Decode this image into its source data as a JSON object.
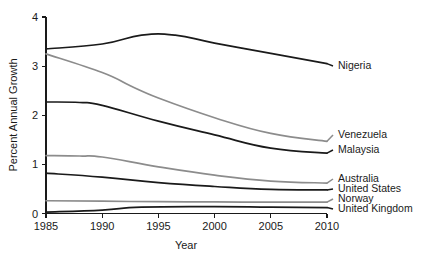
{
  "chart_data": {
    "type": "line",
    "title": "",
    "xlabel": "Year",
    "ylabel": "Percent Annual Growth",
    "xlim": [
      1985,
      2010
    ],
    "ylim": [
      0,
      4
    ],
    "grid": false,
    "legend_position": "right-inline-labels",
    "x": [
      1985,
      1990,
      1995,
      2000,
      2005,
      2010
    ],
    "xticks": [
      "1985",
      "1990",
      "1995",
      "2000",
      "2005",
      "2010"
    ],
    "yticks": [
      "0",
      "1",
      "2",
      "3",
      "4"
    ],
    "series": [
      {
        "name": "Nigeria",
        "color": "#1a1a1a",
        "label": "Nigeria",
        "values": [
          3.35,
          3.45,
          3.63,
          3.52,
          3.3,
          3.05
        ],
        "points": [
          {
            "x": 1985,
            "y": 3.35
          },
          {
            "x": 1990,
            "y": 3.45
          },
          {
            "x": 1993.5,
            "y": 3.63
          },
          {
            "x": 1996.5,
            "y": 3.63
          },
          {
            "x": 2000,
            "y": 3.47
          },
          {
            "x": 2005,
            "y": 3.26
          },
          {
            "x": 2010,
            "y": 3.05
          }
        ]
      },
      {
        "name": "Venezuela",
        "color": "#8c8c8c",
        "label": "Venezuela",
        "values": [
          3.25,
          2.87,
          2.35,
          1.95,
          1.63,
          1.47
        ],
        "points": [
          {
            "x": 1985,
            "y": 3.25
          },
          {
            "x": 1990,
            "y": 2.87
          },
          {
            "x": 1992.5,
            "y": 2.6
          },
          {
            "x": 1995,
            "y": 2.35
          },
          {
            "x": 2000,
            "y": 1.95
          },
          {
            "x": 2005,
            "y": 1.63
          },
          {
            "x": 2010,
            "y": 1.47
          }
        ]
      },
      {
        "name": "Malaysia",
        "color": "#1a1a1a",
        "label": "Malaysia",
        "values": [
          2.27,
          2.2,
          1.88,
          1.6,
          1.33,
          1.23
        ],
        "points": [
          {
            "x": 1985,
            "y": 2.27
          },
          {
            "x": 1988,
            "y": 2.26
          },
          {
            "x": 1990,
            "y": 2.2
          },
          {
            "x": 1995,
            "y": 1.88
          },
          {
            "x": 2000,
            "y": 1.6
          },
          {
            "x": 2005,
            "y": 1.33
          },
          {
            "x": 2010,
            "y": 1.23
          }
        ]
      },
      {
        "name": "Australia",
        "color": "#8c8c8c",
        "label": "Australia",
        "values": [
          1.18,
          1.17,
          0.95,
          0.78,
          0.66,
          0.62
        ],
        "points": [
          {
            "x": 1985,
            "y": 1.18
          },
          {
            "x": 1988,
            "y": 1.17
          },
          {
            "x": 1990,
            "y": 1.15
          },
          {
            "x": 1995,
            "y": 0.95
          },
          {
            "x": 2000,
            "y": 0.78
          },
          {
            "x": 2005,
            "y": 0.66
          },
          {
            "x": 2010,
            "y": 0.62
          }
        ]
      },
      {
        "name": "United States",
        "color": "#1a1a1a",
        "label": "United States",
        "values": [
          0.82,
          0.74,
          0.63,
          0.55,
          0.49,
          0.48
        ],
        "points": [
          {
            "x": 1985,
            "y": 0.82
          },
          {
            "x": 1990,
            "y": 0.74
          },
          {
            "x": 1995,
            "y": 0.63
          },
          {
            "x": 2000,
            "y": 0.55
          },
          {
            "x": 2005,
            "y": 0.49
          },
          {
            "x": 2010,
            "y": 0.48
          }
        ]
      },
      {
        "name": "Norway",
        "color": "#8c8c8c",
        "label": "Norway",
        "values": [
          0.26,
          0.25,
          0.24,
          0.23,
          0.23,
          0.23
        ],
        "points": [
          {
            "x": 1985,
            "y": 0.26
          },
          {
            "x": 1990,
            "y": 0.25
          },
          {
            "x": 1995,
            "y": 0.24
          },
          {
            "x": 2000,
            "y": 0.235
          },
          {
            "x": 2005,
            "y": 0.23
          },
          {
            "x": 2010,
            "y": 0.23
          }
        ]
      },
      {
        "name": "United Kingdom",
        "color": "#1a1a1a",
        "label": "United Kingdom",
        "values": [
          0.03,
          0.07,
          0.13,
          0.14,
          0.13,
          0.12
        ],
        "points": [
          {
            "x": 1985,
            "y": 0.03
          },
          {
            "x": 1990,
            "y": 0.07
          },
          {
            "x": 1993.5,
            "y": 0.13
          },
          {
            "x": 2000,
            "y": 0.14
          },
          {
            "x": 2005,
            "y": 0.13
          },
          {
            "x": 2010,
            "y": 0.12
          }
        ]
      }
    ]
  },
  "axes": {
    "x_title": "Year",
    "y_title": "Percent Annual Growth"
  }
}
